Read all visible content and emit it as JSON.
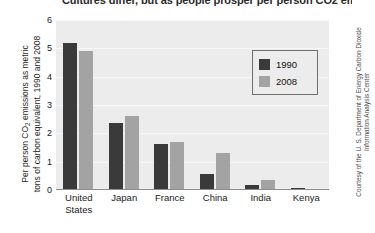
{
  "headline": "Cultures differ, but as people prosper per person CO2 emissions increase.",
  "credit": "Courtesy of the U. S. Department of Energy Carbon Dioxide Information Analysis Center",
  "legend": {
    "items": [
      {
        "label": "1990",
        "color": "#3a3a3a"
      },
      {
        "label": "2008",
        "color": "#a3a3a3"
      }
    ]
  },
  "colors": {
    "series_1990": "#3a3a3a",
    "series_2008": "#a3a3a3",
    "plot_background": "#ececec",
    "gridline": "#f7f7f7",
    "axis": "#8d8d8d"
  },
  "chart_data": {
    "type": "bar",
    "title": "Cultures differ, but as people prosper per person CO2 emissions increase.",
    "xlabel": "",
    "ylabel_line1": "Per person CO",
    "ylabel_sub": "2",
    "ylabel_line2": " emissions as metric",
    "ylabel_line3": "tons of carbon equivalent, 1990 and 2008",
    "categories": [
      "United States",
      "Japan",
      "France",
      "China",
      "India",
      "Kenya"
    ],
    "category_lines": [
      [
        "United",
        "States"
      ],
      [
        "Japan"
      ],
      [
        "France"
      ],
      [
        "China"
      ],
      [
        "India"
      ],
      [
        "Kenya"
      ]
    ],
    "series": [
      {
        "name": "1990",
        "values": [
          5.2,
          2.35,
          1.63,
          0.55,
          0.16,
          0.06
        ]
      },
      {
        "name": "2008",
        "values": [
          4.9,
          2.62,
          1.7,
          1.32,
          0.37,
          0.05
        ]
      }
    ],
    "ylim": [
      0,
      6
    ],
    "yticks": [
      0,
      1,
      2,
      3,
      4,
      5,
      6
    ],
    "grid": true,
    "legend_position": "top-right"
  }
}
